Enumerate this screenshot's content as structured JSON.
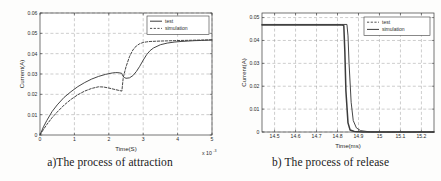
{
  "figures": [
    {
      "id": "attraction",
      "caption": "a)The process of attraction",
      "chart": {
        "type": "line",
        "title": "",
        "xlabel": "Time(S)",
        "ylabel": "Current(A)",
        "x_multiplier": "x 10",
        "x_multiplier_exp": "-3",
        "xlim": [
          0,
          5
        ],
        "ylim": [
          0,
          0.06
        ],
        "xticks": [
          "0",
          "1",
          "2",
          "3",
          "4",
          "5"
        ],
        "yticks": [
          "0",
          "0.01",
          "0.02",
          "0.03",
          "0.04",
          "0.05",
          "0.06"
        ],
        "grid": "dashed",
        "legend_position": "top-right",
        "legend": [
          {
            "label": "test",
            "style": "solid"
          },
          {
            "label": "simulation",
            "style": "dashed"
          }
        ],
        "series": [
          {
            "name": "test",
            "style": "solid",
            "x": [
              0,
              0.1,
              0.2,
              0.35,
              0.5,
              0.7,
              0.9,
              1.1,
              1.3,
              1.5,
              1.7,
              1.9,
              2.1,
              2.2,
              2.3,
              2.38,
              2.4,
              2.45,
              2.5,
              2.6,
              2.7,
              2.8,
              2.9,
              3.0,
              3.1,
              3.2,
              3.3,
              3.5,
              3.7,
              3.9,
              4.1,
              4.3,
              4.5,
              4.7,
              5.0
            ],
            "y": [
              0,
              0.004,
              0.0072,
              0.0115,
              0.0148,
              0.0185,
              0.0213,
              0.0238,
              0.0258,
              0.0275,
              0.0288,
              0.0298,
              0.0305,
              0.0307,
              0.0306,
              0.0303,
              0.0292,
              0.0283,
              0.0279,
              0.0281,
              0.0292,
              0.0312,
              0.0338,
              0.0368,
              0.0395,
              0.0415,
              0.0428,
              0.0444,
              0.0452,
              0.0457,
              0.046,
              0.0462,
              0.0464,
              0.0465,
              0.0467
            ]
          },
          {
            "name": "simulation",
            "style": "dashed",
            "x": [
              0,
              0.1,
              0.2,
              0.35,
              0.5,
              0.7,
              0.9,
              1.1,
              1.3,
              1.5,
              1.7,
              1.85,
              2.0,
              2.15,
              2.3,
              2.38,
              2.42,
              2.5,
              2.6,
              2.7,
              2.8,
              2.9,
              3.0,
              3.1,
              3.2,
              3.35,
              3.5,
              3.7,
              3.9,
              4.1,
              4.4,
              4.7,
              5.0
            ],
            "y": [
              0,
              0.0027,
              0.0052,
              0.0085,
              0.0113,
              0.0147,
              0.0175,
              0.0198,
              0.0216,
              0.0229,
              0.0237,
              0.0236,
              0.0231,
              0.0225,
              0.0219,
              0.0216,
              0.0283,
              0.0335,
              0.0385,
              0.0418,
              0.0438,
              0.0449,
              0.0455,
              0.0458,
              0.046,
              0.0461,
              0.0462,
              0.0463,
              0.0464,
              0.0465,
              0.0466,
              0.0467,
              0.0468
            ]
          }
        ]
      }
    },
    {
      "id": "release",
      "caption": "b) The process of release",
      "chart": {
        "type": "line",
        "title": "",
        "xlabel": "Time(ms)",
        "ylabel": "Current(A)",
        "xlim": [
          14.44,
          15.26
        ],
        "ylim": [
          0,
          0.052
        ],
        "xticks": [
          "14.5",
          "14.6",
          "14.7",
          "14.8",
          "14.9",
          "15",
          "15.1",
          "15.2"
        ],
        "xtick_values": [
          14.5,
          14.6,
          14.7,
          14.8,
          14.9,
          15.0,
          15.1,
          15.2
        ],
        "yticks": [
          "0",
          "0.01",
          "0.02",
          "0.03",
          "0.04",
          "0.05"
        ],
        "grid": "dashed",
        "legend_position": "top-right",
        "legend": [
          {
            "label": "test",
            "style": "dashed"
          },
          {
            "label": "simulation",
            "style": "solid"
          }
        ],
        "series": [
          {
            "name": "test",
            "style": "noisy-solid",
            "x": [
              14.44,
              14.6,
              14.75,
              14.8,
              14.82,
              14.83,
              14.835,
              14.84,
              14.85,
              14.86,
              14.88,
              14.92,
              15.0,
              15.1,
              15.26
            ],
            "y": [
              0.0468,
              0.0468,
              0.0468,
              0.0468,
              0.0468,
              0.0465,
              0.035,
              0.018,
              0.004,
              0.0009,
              0.0002,
              0.0,
              0.0,
              0.0,
              0.0
            ]
          },
          {
            "name": "simulation",
            "style": "solid",
            "x": [
              14.44,
              14.6,
              14.75,
              14.82,
              14.845,
              14.85,
              14.855,
              14.865,
              14.875,
              14.89,
              14.91,
              14.95,
              15.0,
              15.1,
              15.26
            ],
            "y": [
              0.047,
              0.047,
              0.047,
              0.047,
              0.047,
              0.042,
              0.03,
              0.013,
              0.005,
              0.0018,
              0.0006,
              0.0001,
              0.0,
              0.0,
              0.0
            ]
          }
        ]
      }
    }
  ]
}
